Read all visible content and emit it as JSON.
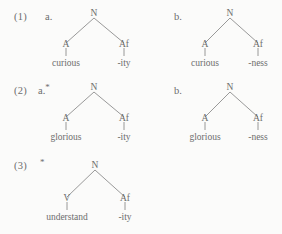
{
  "colors": {
    "background": "#fbfbfa",
    "text": "#6d6d6d",
    "branch": "#8d8d8d"
  },
  "examples": [
    {
      "number": "(1)",
      "sub": "a.",
      "grammatical": true,
      "tree": {
        "root": "N",
        "left_node": "A",
        "left_leaf": "curious",
        "right_node": "Af",
        "right_leaf": "-ity"
      }
    },
    {
      "number": "",
      "sub": "b.",
      "grammatical": true,
      "tree": {
        "root": "N",
        "left_node": "A",
        "left_leaf": "curious",
        "right_node": "Af",
        "right_leaf": "-ness"
      }
    },
    {
      "number": "(2)",
      "sub": "a.",
      "grammatical": false,
      "tree": {
        "root": "N",
        "left_node": "A",
        "left_leaf": "glorious",
        "right_node": "Af",
        "right_leaf": "-ity"
      }
    },
    {
      "number": "",
      "sub": "b.",
      "grammatical": true,
      "tree": {
        "root": "N",
        "left_node": "A",
        "left_leaf": "glorious",
        "right_node": "Af",
        "right_leaf": "-ness"
      }
    },
    {
      "number": "(3)",
      "sub": "",
      "grammatical": false,
      "tree": {
        "root": "N",
        "left_node": "V",
        "left_leaf": "understand",
        "right_node": "Af",
        "right_leaf": "-ity"
      }
    }
  ],
  "ungrammatical_marker": "*"
}
